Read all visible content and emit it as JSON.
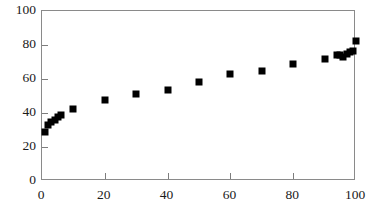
{
  "chart_data": {
    "type": "scatter",
    "title": "",
    "subtitle": "",
    "xlabel": "",
    "ylabel": "",
    "xlim": [
      0,
      100
    ],
    "ylim": [
      0,
      100
    ],
    "xticks": [
      0,
      20,
      40,
      60,
      80,
      100
    ],
    "yticks": [
      0,
      20,
      40,
      60,
      80,
      100
    ],
    "xtick_labels": [
      "0",
      "20",
      "40",
      "60",
      "80",
      "100"
    ],
    "ytick_labels": [
      "0",
      "20",
      "40",
      "60",
      "80",
      "100"
    ],
    "grid": false,
    "legend": null,
    "legend_position": "none",
    "annotations": [],
    "marker": {
      "shape": "square",
      "color": "#000000",
      "size": 7
    },
    "frame_color": "#8a8a8a",
    "background": "#ffffff",
    "series": [
      {
        "name": "series-1",
        "points": [
          {
            "x": 1,
            "y": 29
          },
          {
            "x": 2,
            "y": 33
          },
          {
            "x": 3,
            "y": 34.5
          },
          {
            "x": 4,
            "y": 36
          },
          {
            "x": 5,
            "y": 37.5
          },
          {
            "x": 6,
            "y": 39
          },
          {
            "x": 10,
            "y": 42.5
          },
          {
            "x": 20,
            "y": 47.5
          },
          {
            "x": 30,
            "y": 51
          },
          {
            "x": 40,
            "y": 53.5
          },
          {
            "x": 50,
            "y": 58
          },
          {
            "x": 60,
            "y": 63
          },
          {
            "x": 70,
            "y": 65
          },
          {
            "x": 80,
            "y": 69
          },
          {
            "x": 90,
            "y": 71.5
          },
          {
            "x": 94,
            "y": 74
          },
          {
            "x": 95,
            "y": 74
          },
          {
            "x": 96,
            "y": 73
          },
          {
            "x": 97,
            "y": 74.5
          },
          {
            "x": 98,
            "y": 76
          },
          {
            "x": 99,
            "y": 76.5
          },
          {
            "x": 100,
            "y": 82.5
          }
        ]
      }
    ]
  }
}
